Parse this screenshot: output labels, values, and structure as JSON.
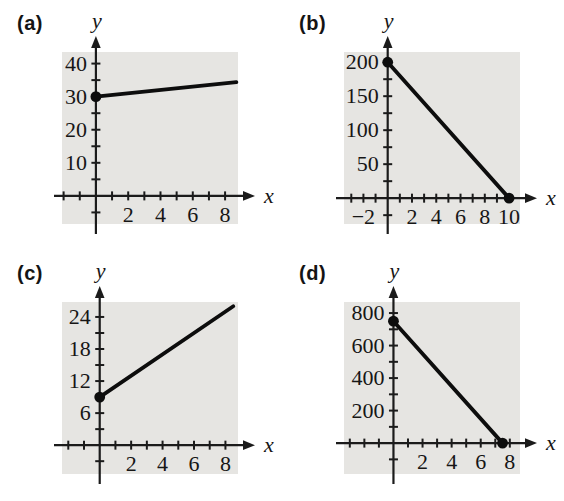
{
  "figure": {
    "background": "#ffffff"
  },
  "colors": {
    "plot_bg": "#e6e5e2",
    "axis": "#1b1b1b",
    "line": "#0d0d0d",
    "text": "#161616"
  },
  "chart_data": [
    {
      "id": "a",
      "label": "(a)",
      "type": "line",
      "xlabel": "x",
      "ylabel": "y",
      "x_axis": {
        "minor_step": 1,
        "area_range": [
          -2.1,
          8.8
        ],
        "tick_labels": [
          {
            "value": 2,
            "text": "2"
          },
          {
            "value": 4,
            "text": "4"
          },
          {
            "value": 6,
            "text": "6"
          },
          {
            "value": 8,
            "text": "8"
          }
        ]
      },
      "y_axis": {
        "minor_step": 5,
        "area_range": [
          -8.5,
          43.5
        ],
        "tick_labels": [
          {
            "value": 10,
            "text": "10"
          },
          {
            "value": 20,
            "text": "20"
          },
          {
            "value": 30,
            "text": "30"
          },
          {
            "value": 40,
            "text": "40"
          }
        ]
      },
      "line": {
        "points": [
          [
            0,
            30
          ],
          [
            8.7,
            34.4
          ]
        ],
        "dots": [
          [
            0,
            30
          ]
        ]
      }
    },
    {
      "id": "b",
      "label": "(b)",
      "type": "line",
      "xlabel": "x",
      "ylabel": "y",
      "x_axis": {
        "minor_step": 1,
        "area_range": [
          -3.6,
          10.9
        ],
        "tick_labels": [
          {
            "value": -2,
            "text": "−2"
          },
          {
            "value": 2,
            "text": "2"
          },
          {
            "value": 4,
            "text": "4"
          },
          {
            "value": 6,
            "text": "6"
          },
          {
            "value": 8,
            "text": "8"
          },
          {
            "value": 10,
            "text": "10"
          }
        ]
      },
      "y_axis": {
        "minor_step": 25,
        "area_range": [
          -38,
          215
        ],
        "tick_labels": [
          {
            "value": 50,
            "text": "50"
          },
          {
            "value": 100,
            "text": "100"
          },
          {
            "value": 150,
            "text": "150"
          },
          {
            "value": 200,
            "text": "200"
          }
        ]
      },
      "line": {
        "points": [
          [
            0,
            200
          ],
          [
            10,
            0
          ]
        ],
        "dots": [
          [
            0,
            200
          ],
          [
            10,
            0
          ]
        ]
      }
    },
    {
      "id": "c",
      "label": "(c)",
      "type": "line",
      "xlabel": "x",
      "ylabel": "y",
      "x_axis": {
        "minor_step": 1,
        "area_range": [
          -2.4,
          8.8
        ],
        "tick_labels": [
          {
            "value": 2,
            "text": "2"
          },
          {
            "value": 4,
            "text": "4"
          },
          {
            "value": 6,
            "text": "6"
          },
          {
            "value": 8,
            "text": "8"
          }
        ]
      },
      "y_axis": {
        "minor_step": 3,
        "area_range": [
          -5.4,
          26.8
        ],
        "tick_labels": [
          {
            "value": 6,
            "text": "6"
          },
          {
            "value": 12,
            "text": "12"
          },
          {
            "value": 18,
            "text": "18"
          },
          {
            "value": 24,
            "text": "24"
          }
        ]
      },
      "line": {
        "points": [
          [
            0,
            9
          ],
          [
            8.5,
            26
          ]
        ],
        "dots": [
          [
            0,
            9
          ]
        ]
      }
    },
    {
      "id": "d",
      "label": "(d)",
      "type": "line",
      "xlabel": "x",
      "ylabel": "y",
      "x_axis": {
        "minor_step": 1,
        "area_range": [
          -3.4,
          8.7
        ],
        "tick_labels": [
          {
            "value": 2,
            "text": "2"
          },
          {
            "value": 4,
            "text": "4"
          },
          {
            "value": 6,
            "text": "6"
          },
          {
            "value": 8,
            "text": "8"
          }
        ]
      },
      "y_axis": {
        "minor_step": 100,
        "area_range": [
          -190,
          868
        ],
        "tick_labels": [
          {
            "value": 200,
            "text": "200"
          },
          {
            "value": 400,
            "text": "400"
          },
          {
            "value": 600,
            "text": "600"
          },
          {
            "value": 800,
            "text": "800"
          }
        ]
      },
      "line": {
        "points": [
          [
            0,
            750
          ],
          [
            7.5,
            0
          ]
        ],
        "dots": [
          [
            0,
            750
          ],
          [
            7.5,
            0
          ]
        ]
      }
    }
  ]
}
